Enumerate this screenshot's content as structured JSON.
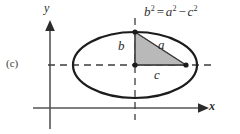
{
  "figure": {
    "panel_label": "(c)",
    "equation": {
      "lhs_base": "b",
      "lhs_exp": "2",
      "equals": "=",
      "rhs1_base": "a",
      "rhs1_exp": "2",
      "minus": "−",
      "rhs2_base": "c",
      "rhs2_exp": "2",
      "plain": "b² = a² − c²"
    },
    "axes": {
      "x_label": "x",
      "y_label": "y",
      "x_axis_name": "horizontal-axis",
      "y_axis_name": "vertical-axis"
    },
    "shape": {
      "name": "ellipse",
      "center_x": 135,
      "center_y": 65,
      "semi_major_px": 62,
      "semi_minor_px": 33,
      "stroke_color": "#1c1c1c",
      "stroke_width": 2.2
    },
    "triangle": {
      "fill_color": "#b9b9b9",
      "stroke_color": "#4a4a4a",
      "vertices": [
        {
          "name": "ellipse-top-vertex",
          "x": 135,
          "y": 32
        },
        {
          "name": "ellipse-center",
          "x": 135,
          "y": 65
        },
        {
          "name": "right-focus",
          "x": 186,
          "y": 65
        }
      ],
      "labels": {
        "vertical_leg": "b",
        "hypotenuse": "a",
        "horizontal_leg": "c"
      }
    },
    "dashed_lines": {
      "color": "#3d3d3d",
      "dash_pattern": "7 5",
      "horizontal": {
        "x1": 48,
        "x2": 216,
        "y": 65
      },
      "vertical": {
        "x": 135,
        "y1": 18,
        "y2": 120
      }
    },
    "points": [
      {
        "name": "ellipse-top-point",
        "x": 135,
        "y": 32
      },
      {
        "name": "center-point",
        "x": 135,
        "y": 65
      },
      {
        "name": "right-focus-point",
        "x": 186,
        "y": 65
      }
    ]
  }
}
